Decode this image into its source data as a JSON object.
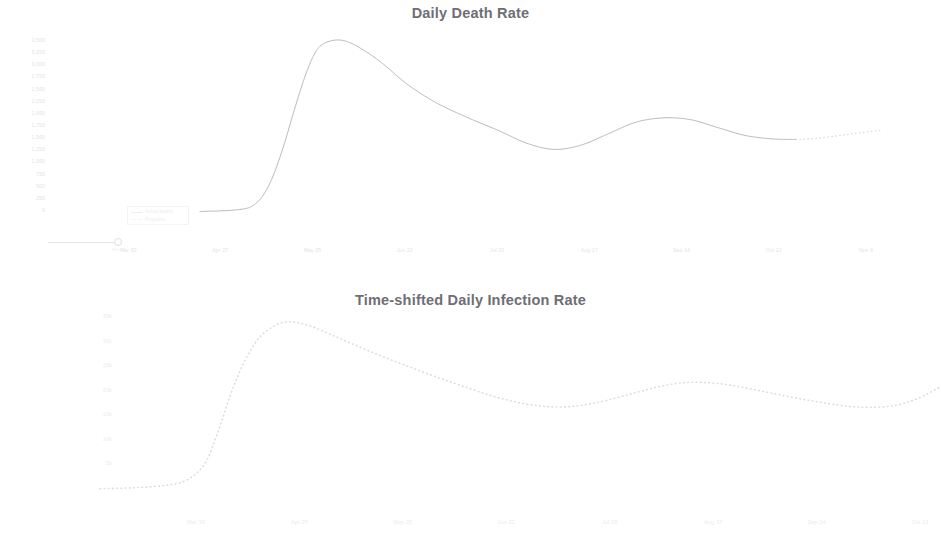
{
  "page": {
    "background": "#ffffff",
    "line_color": "#b9b9c0",
    "dotted_color": "#d8d8de",
    "title_color": "#6e6e74",
    "tick_color": "#e6e6ea"
  },
  "charts": [
    {
      "id": "daily-death-rate",
      "title": "Daily Death Rate",
      "type": "line",
      "xlabel": "",
      "ylabel": "",
      "grid": false,
      "legend_position": "lower-left",
      "legend": [
        {
          "label": "Actual deaths",
          "style": "solid"
        },
        {
          "label": "Projection",
          "style": "dotted"
        }
      ],
      "marker": {
        "label": "Mar 30",
        "style": "open-circle"
      },
      "y_ticks": [
        "3,500",
        "3,250",
        "3,000",
        "2,750",
        "2,500",
        "2,250",
        "2,000",
        "1,750",
        "1,500",
        "1,250",
        "1,000",
        "750",
        "500",
        "250",
        "0"
      ],
      "x_ticks": [
        "Mar 30",
        "Apr 27",
        "May 25",
        "Jun 22",
        "Jul 20",
        "Aug 17",
        "Sep 14",
        "Oct 12",
        "Nov 9"
      ],
      "ylim": [
        0,
        3500
      ],
      "series": [
        {
          "name": "Actual deaths",
          "style": "solid",
          "x": [
            0.0,
            0.055,
            0.08,
            0.1,
            0.12,
            0.14,
            0.155,
            0.168,
            0.18,
            0.2,
            0.22,
            0.245,
            0.27,
            0.3,
            0.33,
            0.36,
            0.4,
            0.44,
            0.48,
            0.52,
            0.56,
            0.6,
            0.64,
            0.68,
            0.72,
            0.76,
            0.8,
            0.84,
            0.875
          ],
          "y": [
            0.02,
            0.03,
            0.06,
            0.16,
            0.36,
            0.62,
            0.8,
            0.92,
            0.975,
            1.0,
            0.985,
            0.93,
            0.86,
            0.76,
            0.68,
            0.615,
            0.545,
            0.48,
            0.41,
            0.375,
            0.4,
            0.465,
            0.53,
            0.555,
            0.545,
            0.5,
            0.455,
            0.435,
            0.432
          ]
        },
        {
          "name": "Projection",
          "style": "dotted",
          "x": [
            0.875,
            0.9,
            0.93,
            0.96,
            1.0
          ],
          "y": [
            0.432,
            0.437,
            0.45,
            0.465,
            0.485
          ]
        }
      ]
    },
    {
      "id": "time-shifted-daily-infection-rate",
      "title": "Time-shifted Daily Infection Rate",
      "type": "line",
      "xlabel": "",
      "ylabel": "",
      "grid": false,
      "legend_position": "none",
      "legend": [],
      "y_ticks": [
        "35k",
        "30k",
        "25k",
        "20k",
        "15k",
        "10k",
        "5k"
      ],
      "x_ticks": [
        "Mar 30",
        "Apr 27",
        "May 25",
        "Jun 22",
        "Jul 20",
        "Aug 17",
        "Sep 14",
        "Oct 12"
      ],
      "ylim": [
        0,
        35000
      ],
      "series": [
        {
          "name": "Time-shifted infections",
          "style": "dotted",
          "x": [
            0.0,
            0.04,
            0.08,
            0.105,
            0.125,
            0.14,
            0.155,
            0.17,
            0.185,
            0.2,
            0.22,
            0.245,
            0.275,
            0.31,
            0.35,
            0.39,
            0.43,
            0.47,
            0.51,
            0.55,
            0.59,
            0.63,
            0.665,
            0.7,
            0.74,
            0.78,
            0.82,
            0.86,
            0.9,
            0.94,
            0.97,
            1.0
          ],
          "y": [
            0.02,
            0.025,
            0.04,
            0.075,
            0.17,
            0.35,
            0.57,
            0.75,
            0.88,
            0.955,
            1.0,
            0.985,
            0.925,
            0.85,
            0.77,
            0.695,
            0.625,
            0.56,
            0.515,
            0.5,
            0.525,
            0.575,
            0.62,
            0.645,
            0.635,
            0.6,
            0.56,
            0.525,
            0.5,
            0.505,
            0.545,
            0.62
          ]
        }
      ]
    }
  ],
  "chart_data": [
    {
      "type": "line",
      "title": "Daily Death Rate",
      "xlabel": "",
      "ylabel": "Daily deaths",
      "grid": false,
      "legend_position": "lower-left",
      "ylim": [
        0,
        3500
      ],
      "categories": [
        "Mar 30",
        "Apr 27",
        "May 25",
        "Jun 22",
        "Jul 20",
        "Aug 17",
        "Sep 14",
        "Oct 12",
        "Nov 9"
      ],
      "series": [
        {
          "name": "Actual deaths",
          "values": [
            70,
            3500,
            2380,
            1910,
            1440,
            1310,
            1860,
            1750,
            1510
          ]
        },
        {
          "name": "Projection",
          "values": [
            null,
            null,
            null,
            null,
            null,
            null,
            null,
            1510,
            1700
          ]
        }
      ]
    },
    {
      "type": "line",
      "title": "Time-shifted Daily Infection Rate",
      "xlabel": "",
      "ylabel": "Daily infections",
      "grid": false,
      "legend_position": "none",
      "ylim": [
        0,
        35000
      ],
      "categories": [
        "Mar 30",
        "Apr 27",
        "May 25",
        "Jun 22",
        "Jul 20",
        "Aug 17",
        "Sep 14",
        "Oct 12"
      ],
      "series": [
        {
          "name": "Time-shifted infections",
          "values": [
            700,
            34000,
            27000,
            21500,
            18000,
            20500,
            22000,
            18500
          ]
        }
      ]
    }
  ]
}
